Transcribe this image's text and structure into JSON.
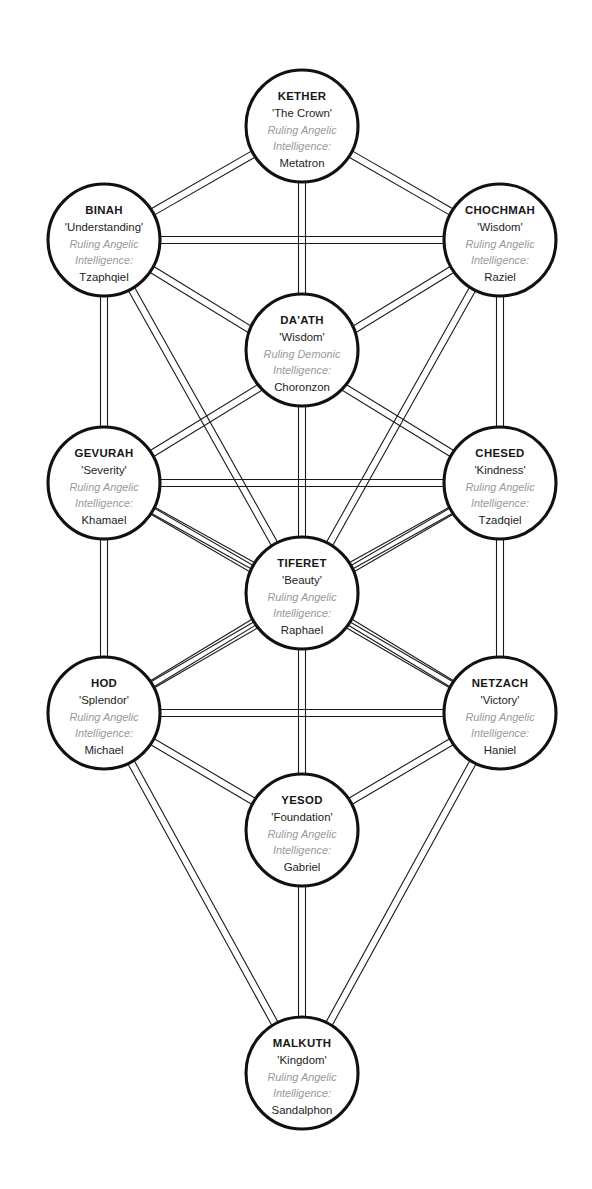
{
  "diagram": {
    "kind": "kabbalistic-tree-of-life",
    "colors": {
      "background": "#ffffff",
      "node_stroke": "#111111",
      "node_fill": "#ffffff",
      "path_stroke": "#1a1a1a",
      "label_text": "#1d1d1d",
      "ruling_text": "#9a9a9a"
    },
    "canvas": {
      "width": 592,
      "height": 1189
    },
    "node_radius": 56,
    "path_gap": 7,
    "nodes": [
      {
        "id": "kether",
        "name": "KETHER",
        "title": "'The Crown'",
        "ruling_line1": "Ruling Angelic",
        "ruling_line2": "Intelligence:",
        "being": "Metatron",
        "cx": 302,
        "cy": 126,
        "r": 56
      },
      {
        "id": "binah",
        "name": "BINAH",
        "title": "'Understanding'",
        "ruling_line1": "Ruling Angelic",
        "ruling_line2": "Intelligence:",
        "being": "Tzaphqiel",
        "cx": 104,
        "cy": 240,
        "r": 56
      },
      {
        "id": "chochmah",
        "name": "CHOCHMAH",
        "title": "'Wisdom'",
        "ruling_line1": "Ruling Angelic",
        "ruling_line2": "Intelligence:",
        "being": "Raziel",
        "cx": 500,
        "cy": 240,
        "r": 56
      },
      {
        "id": "daath",
        "name": "DA'ATH",
        "title": "'Wisdom'",
        "ruling_line1": "Ruling Demonic",
        "ruling_line2": "Intelligence:",
        "being": "Choronzon",
        "cx": 302,
        "cy": 350,
        "r": 56
      },
      {
        "id": "gevurah",
        "name": "GEVURAH",
        "title": "'Severity'",
        "ruling_line1": "Ruling Angelic",
        "ruling_line2": "Intelligence:",
        "being": "Khamael",
        "cx": 104,
        "cy": 483,
        "r": 56
      },
      {
        "id": "chesed",
        "name": "CHESED",
        "title": "'Kindness'",
        "ruling_line1": "Ruling Angelic",
        "ruling_line2": "Intelligence:",
        "being": "Tzadqiel",
        "cx": 500,
        "cy": 483,
        "r": 56
      },
      {
        "id": "tiferet",
        "name": "TIFERET",
        "title": "'Beauty'",
        "ruling_line1": "Ruling Angelic",
        "ruling_line2": "Intelligence:",
        "being": "Raphael",
        "cx": 302,
        "cy": 593,
        "r": 56
      },
      {
        "id": "hod",
        "name": "HOD",
        "title": "'Splendor'",
        "ruling_line1": "Ruling Angelic",
        "ruling_line2": "Intelligence:",
        "being": "Michael",
        "cx": 104,
        "cy": 713,
        "r": 56
      },
      {
        "id": "netzach",
        "name": "NETZACH",
        "title": "'Victory'",
        "ruling_line1": "Ruling Angelic",
        "ruling_line2": "Intelligence:",
        "being": "Haniel",
        "cx": 500,
        "cy": 713,
        "r": 56
      },
      {
        "id": "yesod",
        "name": "YESOD",
        "title": "'Foundation'",
        "ruling_line1": "Ruling Angelic",
        "ruling_line2": "Intelligence:",
        "being": "Gabriel",
        "cx": 302,
        "cy": 830,
        "r": 56
      },
      {
        "id": "malkuth",
        "name": "MALKUTH",
        "title": "'Kingdom'",
        "ruling_line1": "Ruling Angelic",
        "ruling_line2": "Intelligence:",
        "being": "Sandalphon",
        "cx": 302,
        "cy": 1073,
        "r": 56
      }
    ],
    "paths": [
      {
        "from": "kether",
        "to": "binah"
      },
      {
        "from": "kether",
        "to": "chochmah"
      },
      {
        "from": "kether",
        "to": "daath"
      },
      {
        "from": "binah",
        "to": "chochmah"
      },
      {
        "from": "binah",
        "to": "gevurah"
      },
      {
        "from": "binah",
        "to": "tiferet"
      },
      {
        "from": "binah",
        "to": "chesed"
      },
      {
        "from": "chochmah",
        "to": "chesed"
      },
      {
        "from": "chochmah",
        "to": "tiferet"
      },
      {
        "from": "chochmah",
        "to": "gevurah"
      },
      {
        "from": "daath",
        "to": "tiferet"
      },
      {
        "from": "gevurah",
        "to": "chesed"
      },
      {
        "from": "gevurah",
        "to": "tiferet"
      },
      {
        "from": "gevurah",
        "to": "hod"
      },
      {
        "from": "gevurah",
        "to": "netzach"
      },
      {
        "from": "chesed",
        "to": "tiferet"
      },
      {
        "from": "chesed",
        "to": "netzach"
      },
      {
        "from": "chesed",
        "to": "hod"
      },
      {
        "from": "tiferet",
        "to": "hod"
      },
      {
        "from": "tiferet",
        "to": "netzach"
      },
      {
        "from": "tiferet",
        "to": "yesod"
      },
      {
        "from": "hod",
        "to": "netzach"
      },
      {
        "from": "hod",
        "to": "yesod"
      },
      {
        "from": "hod",
        "to": "malkuth"
      },
      {
        "from": "netzach",
        "to": "yesod"
      },
      {
        "from": "netzach",
        "to": "malkuth"
      },
      {
        "from": "yesod",
        "to": "malkuth"
      }
    ]
  }
}
